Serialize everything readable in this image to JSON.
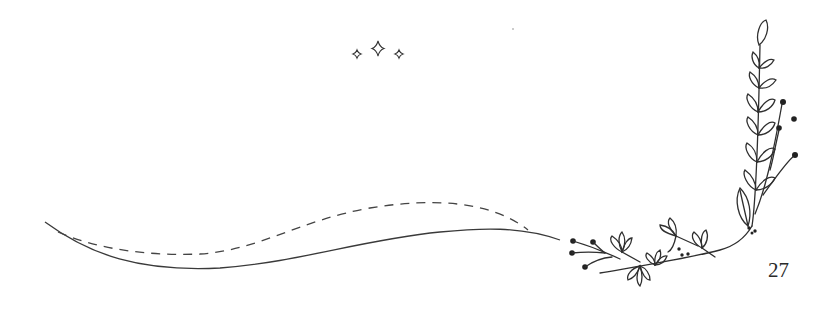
{
  "page": {
    "number": "27"
  },
  "decorations": {
    "sparkles": "sparkles-icon",
    "stray_dot": "dot",
    "wave_solid": "solid-wave-line",
    "wave_dashed": "dashed-wave-line",
    "floral_corner": "floral-branch-illustration"
  },
  "colors": {
    "ink": "#2a2a2a",
    "background": "#ffffff"
  }
}
